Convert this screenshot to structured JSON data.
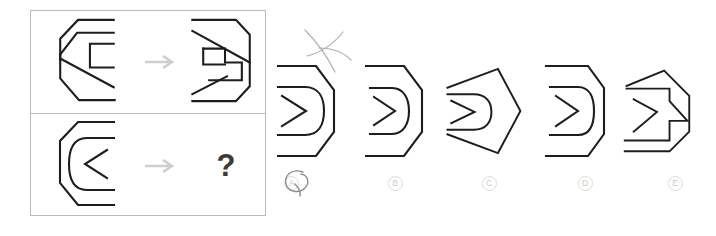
{
  "puzzle": {
    "type": "visual-analogy-matrix",
    "arrow_glyph": "→",
    "question_glyph": "?",
    "rows": [
      {
        "id": "row-top",
        "source_name": "octagon-with-nested-C-bracket",
        "target_name": "hexagon-with-nested-reversed-bracket",
        "relation": "horizontal-mirror"
      },
      {
        "id": "row-bottom",
        "source_name": "octagon-with-nested-rounded-C-and-chevron",
        "target_name": "unknown",
        "relation": "horizontal-mirror"
      }
    ]
  },
  "options": [
    {
      "key": "a",
      "label": "A",
      "shape_name": "hexagon-rounded-chevron-flat-right",
      "marked": true
    },
    {
      "key": "b",
      "label": "B",
      "shape_name": "hexagon-rounded-chevron-narrow",
      "marked": false
    },
    {
      "key": "c",
      "label": "C",
      "shape_name": "pentagon-rounded-chevron-pointed-right",
      "marked": false
    },
    {
      "key": "d",
      "label": "D",
      "shape_name": "hexagon-rounded-chevron-bracket-right",
      "marked": false
    },
    {
      "key": "e",
      "label": "E",
      "shape_name": "heptagon-angular-chevron-stepped",
      "marked": false
    }
  ],
  "annotations": [
    {
      "name": "pen-x-mark",
      "over": "option-a",
      "glyph": "X"
    },
    {
      "name": "pen-circle-mark",
      "over": "option-label-a",
      "glyph": "circle"
    }
  ],
  "colors": {
    "stroke": "#1d1d1d",
    "frame": "#b9b9b9",
    "arrow": "#cfcfcf",
    "question": "#3a3a3a",
    "label": "#cdcdcd",
    "pen": "#8e8e8e",
    "background": "#ffffff"
  }
}
